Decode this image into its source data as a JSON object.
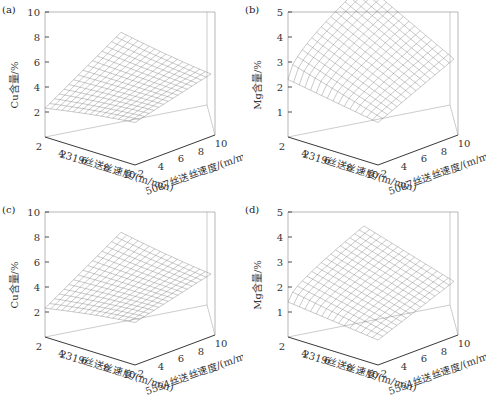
{
  "chart_data": [
    {
      "panel": "(a)",
      "type": "surface3d",
      "zlabel": "Cu含量/%",
      "xlabel": "2319丝送丝速度/(m/min)",
      "ylabel": "5087丝送丝速度/(m/min)",
      "zticks": [
        2,
        4,
        6,
        8,
        10
      ],
      "xticks": [
        2,
        4,
        6,
        8,
        10
      ],
      "yticks": [
        2,
        4,
        6,
        8,
        10
      ],
      "zlim": [
        0,
        10
      ],
      "xlim": [
        2,
        10
      ],
      "ylim": [
        2,
        10
      ],
      "surface_range": [
        2.0,
        4.8
      ],
      "description": "Cu content ~3.5% at low 2319 speed, forming a lens-shaped surface that converges to ~3.3% at high speeds"
    },
    {
      "panel": "(b)",
      "type": "surface3d",
      "zlabel": "Mg含量/%",
      "xlabel": "2319丝送丝速度/(m/min)",
      "ylabel": "5087丝送丝速度/(m/min)",
      "zticks": [
        1,
        2,
        3,
        4,
        5
      ],
      "xticks": [
        2,
        4,
        6,
        8,
        10
      ],
      "yticks": [
        2,
        4,
        6,
        8,
        10
      ],
      "zlim": [
        0,
        5
      ],
      "xlim": [
        2,
        10
      ],
      "ylim": [
        2,
        10
      ],
      "surface_range": [
        0.5,
        4.3
      ],
      "description": "Mg content increases with 5087 speed up to ~4.2%, decreasing as 2319 speed increases"
    },
    {
      "panel": "(c)",
      "type": "surface3d",
      "zlabel": "Cu含量/%",
      "xlabel": "2319丝送丝速度/(m/min)",
      "ylabel": "5554丝送丝速度/(m/min)",
      "zticks": [
        2,
        4,
        6,
        8,
        10
      ],
      "xticks": [
        2,
        4,
        6,
        8,
        10
      ],
      "yticks": [
        2,
        4,
        6,
        8,
        10
      ],
      "zlim": [
        0,
        10
      ],
      "xlim": [
        2,
        10
      ],
      "ylim": [
        2,
        10
      ],
      "surface_range": [
        1.8,
        4.8
      ],
      "description": "Cu content surface similar to (a), converging to ~3.2%"
    },
    {
      "panel": "(d)",
      "type": "surface3d",
      "zlabel": "Mg含量/%",
      "xlabel": "2319丝送丝速度/(m/min)",
      "ylabel": "5554丝送丝速度/(m/min)",
      "zticks": [
        1,
        2,
        3,
        4,
        5
      ],
      "xticks": [
        2,
        4,
        6,
        8,
        10
      ],
      "yticks": [
        2,
        4,
        6,
        8,
        10
      ],
      "zlim": [
        0,
        5
      ],
      "xlim": [
        2,
        10
      ],
      "ylim": [
        2,
        10
      ],
      "surface_range": [
        0.3,
        2.6
      ],
      "description": "Mg content lower, max ~2.5%, decreasing as 2319 speed increases"
    }
  ],
  "panels": [
    {
      "label": "(a)",
      "zlabel": "Cu含量/%",
      "xlabel": "2319丝送丝速度/(m/min)",
      "ylabel": "5087丝送丝速度/(m/min)",
      "zticks": [
        "2",
        "4",
        "6",
        "8",
        "10"
      ]
    },
    {
      "label": "(b)",
      "zlabel": "Mg含量/%",
      "xlabel": "2319丝送丝速度/(m/min)",
      "ylabel": "5087丝送丝速度/(m/min)",
      "zticks": [
        "1",
        "2",
        "3",
        "4",
        "5"
      ]
    },
    {
      "label": "(c)",
      "zlabel": "Cu含量/%",
      "xlabel": "2319丝送丝速度/(m/min)",
      "ylabel": "5554丝送丝速度/(m/min)",
      "zticks": [
        "2",
        "4",
        "6",
        "8",
        "10"
      ]
    },
    {
      "label": "(d)",
      "zlabel": "Mg含量/%",
      "xlabel": "2319丝送丝速度/(m/min)",
      "ylabel": "5554丝送丝速度/(m/min)",
      "zticks": [
        "1",
        "2",
        "3",
        "4",
        "5"
      ]
    }
  ],
  "xticks": [
    "2",
    "4",
    "6",
    "8",
    "10"
  ],
  "yticks": [
    "2",
    "4",
    "6",
    "8",
    "10"
  ]
}
